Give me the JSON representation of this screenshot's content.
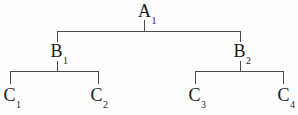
{
  "diagram": {
    "type": "tree",
    "background_color": "#fefefe",
    "line_color": "#4a4a4a",
    "text_color": "#1b1b1b",
    "nodes": {
      "a1": {
        "base": "A",
        "sub": "1"
      },
      "b1": {
        "base": "B",
        "sub": "1"
      },
      "b2": {
        "base": "B",
        "sub": "2"
      },
      "c1": {
        "base": "C",
        "sub": "1"
      },
      "c2": {
        "base": "C",
        "sub": "2"
      },
      "c3": {
        "base": "C",
        "sub": "3"
      },
      "c4": {
        "base": "C",
        "sub": "4"
      }
    },
    "edges": [
      {
        "from": "a1",
        "to": "b1"
      },
      {
        "from": "a1",
        "to": "b2"
      },
      {
        "from": "b1",
        "to": "c1"
      },
      {
        "from": "b1",
        "to": "c2"
      },
      {
        "from": "b2",
        "to": "c3"
      },
      {
        "from": "b2",
        "to": "c4"
      }
    ]
  }
}
